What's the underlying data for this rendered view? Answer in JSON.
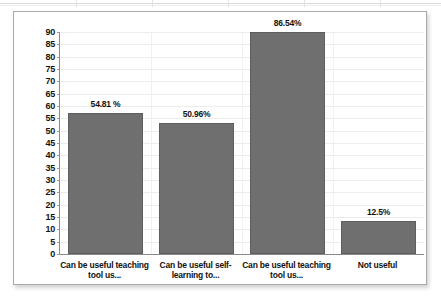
{
  "figure": {
    "background_color": "#ffffff",
    "frame_border_color": "#a9a9a9",
    "bar_color": "#6f6f6f",
    "axis_color": "#8a8a8a",
    "gridline_color": "#ededed",
    "text_color": "#121212"
  },
  "chart_data": {
    "type": "bar",
    "title": "",
    "xlabel": "",
    "ylabel": "",
    "ylim": [
      0,
      90
    ],
    "grid": true,
    "legend_position": "none",
    "y_ticks": [
      0,
      5,
      10,
      15,
      20,
      25,
      30,
      35,
      40,
      45,
      50,
      55,
      60,
      65,
      70,
      75,
      80,
      85,
      90
    ],
    "y_tick_labels": [
      "0",
      "5",
      "10",
      "15",
      "20",
      "25",
      "30",
      "35",
      "40",
      "45",
      "50",
      "55",
      "60",
      "65",
      "70",
      "75",
      "80",
      "85",
      "90"
    ],
    "categories": [
      "Can be useful teaching tool us...",
      "Can be useful self-learning to...",
      "Can be useful teaching tool us...",
      "Not useful"
    ],
    "category_lines": [
      [
        "Can be useful teaching",
        "tool us..."
      ],
      [
        "Can be useful self-",
        "learning to..."
      ],
      [
        "Can be useful teaching",
        "tool us..."
      ],
      [
        "Not useful",
        ""
      ]
    ],
    "values": [
      54.81,
      50.96,
      86.54,
      12.5
    ],
    "plotted_heights": [
      57.0,
      53.3,
      90.0,
      13.4
    ],
    "data_labels": [
      "54.81 %",
      "50.96%",
      "86.54%",
      "12.5%"
    ]
  }
}
